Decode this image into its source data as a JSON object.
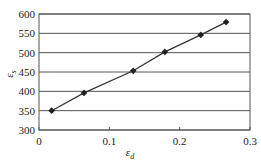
{
  "chart_data": {
    "type": "line",
    "title": "",
    "xlabel": "ε_d",
    "ylabel": "ε_s",
    "xlim": [
      0,
      0.3
    ],
    "ylim": [
      300,
      600
    ],
    "xticks": [
      0,
      0.1,
      0.2,
      0.3
    ],
    "xtick_labels": [
      "0",
      "0.1",
      "0.2",
      "0.3"
    ],
    "yticks": [
      300,
      350,
      400,
      450,
      500,
      550,
      600
    ],
    "ytick_labels": [
      "300",
      "350",
      "400",
      "450",
      "500",
      "550",
      "600"
    ],
    "grid": {
      "horizontal": true,
      "vertical": false
    },
    "legend": null,
    "series": [
      {
        "name": "",
        "marker": "diamond",
        "color": "#222222",
        "x": [
          0.018,
          0.064,
          0.134,
          0.179,
          0.23,
          0.266
        ],
        "y": [
          350,
          396,
          453,
          502,
          546,
          579
        ]
      }
    ]
  },
  "labels": {
    "xlabel_main": "ε",
    "xlabel_sub": "d",
    "ylabel_main": "ε",
    "ylabel_sub": "s"
  }
}
